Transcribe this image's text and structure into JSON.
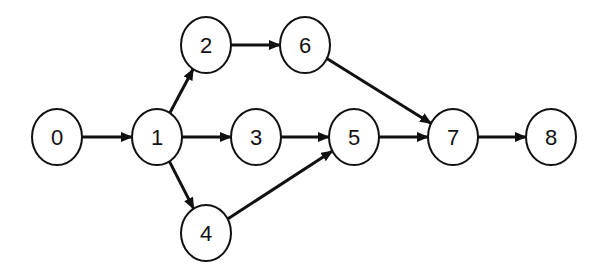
{
  "diagram": {
    "type": "directed-graph",
    "nodes": [
      {
        "id": "0",
        "label": "0",
        "x": 57,
        "y": 137
      },
      {
        "id": "1",
        "label": "1",
        "x": 157,
        "y": 137
      },
      {
        "id": "2",
        "label": "2",
        "x": 206,
        "y": 45
      },
      {
        "id": "3",
        "label": "3",
        "x": 256,
        "y": 137
      },
      {
        "id": "4",
        "label": "4",
        "x": 206,
        "y": 233
      },
      {
        "id": "5",
        "label": "5",
        "x": 354,
        "y": 137
      },
      {
        "id": "6",
        "label": "6",
        "x": 305,
        "y": 45
      },
      {
        "id": "7",
        "label": "7",
        "x": 453,
        "y": 137
      },
      {
        "id": "8",
        "label": "8",
        "x": 551,
        "y": 137
      }
    ],
    "edges": [
      {
        "from": "0",
        "to": "1"
      },
      {
        "from": "1",
        "to": "2"
      },
      {
        "from": "1",
        "to": "3"
      },
      {
        "from": "1",
        "to": "4"
      },
      {
        "from": "2",
        "to": "6"
      },
      {
        "from": "3",
        "to": "5"
      },
      {
        "from": "4",
        "to": "5"
      },
      {
        "from": "5",
        "to": "7"
      },
      {
        "from": "6",
        "to": "7"
      },
      {
        "from": "7",
        "to": "8"
      }
    ],
    "colors": {
      "stroke": "#111111",
      "fill": "#ffffff",
      "background": "#ffffff"
    }
  }
}
